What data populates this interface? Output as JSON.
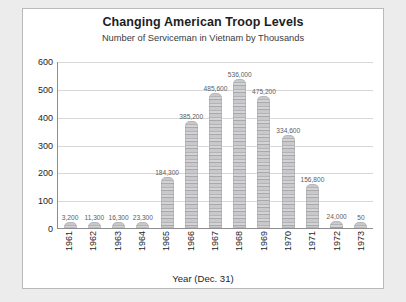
{
  "chart_data": {
    "type": "bar",
    "title": "Changing American Troop Levels",
    "subtitle": "Number of Serviceman in Vietnam by Thousands",
    "xlabel": "Year (Dec. 31)",
    "ylabel": "",
    "ylim": [
      0,
      600
    ],
    "yticks": [
      0,
      100,
      200,
      300,
      400,
      500,
      600
    ],
    "ytick_labels": [
      "0",
      "100",
      "200",
      "300",
      "400",
      "500",
      "600"
    ],
    "grid": true,
    "legend": "none",
    "units": "thousands",
    "categories": [
      "1961",
      "1962",
      "1963",
      "1964",
      "1965",
      "1966",
      "1967",
      "1968",
      "1969",
      "1970",
      "1971",
      "1972",
      "1973"
    ],
    "values": [
      3.2,
      11.3,
      16.3,
      23.3,
      184.3,
      385.2,
      485.6,
      536.0,
      475.2,
      334.6,
      156.8,
      24.0,
      0.05
    ],
    "point_labels": [
      "3,200",
      "11,300",
      "16,300",
      "23,300",
      "184,300",
      "385,200",
      "485,600",
      "536,000",
      "475,200",
      "334,600",
      "156,800",
      "24,000",
      "50"
    ],
    "bar_style": "pictograph-soldier-stack",
    "colors": {
      "bar": "#c4c4c6",
      "gridline": "#d8d8da",
      "axis": "#8e8e90",
      "panel_background": "#ffffff",
      "page_background": "#ececed",
      "title_text": "#1d1d1f",
      "label_text": "#5c5c5e"
    }
  }
}
